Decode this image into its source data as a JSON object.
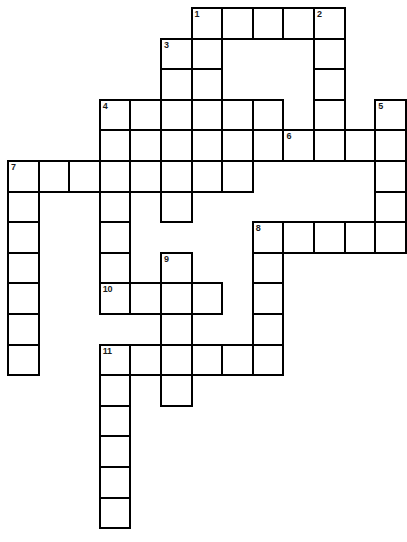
{
  "puzzle": {
    "title": "Crossword puzzle grid",
    "kind": "blank-crossword-grid",
    "cell_size": 30.6,
    "origin_x": 7,
    "origin_y": 7,
    "columns": 13,
    "rows": 17,
    "ink_color": "#000000",
    "cell_color": "#ffffff",
    "page_color": "#ffffff",
    "numbers": [
      "1",
      "2",
      "3",
      "4",
      "5",
      "6",
      "7",
      "8",
      "9",
      "10",
      "11"
    ],
    "entries": [
      {
        "number": "1",
        "direction": "across",
        "row": 0,
        "col": 6,
        "length": 5
      },
      {
        "number": "2",
        "direction": "down",
        "row": 0,
        "col": 10,
        "length": 5
      },
      {
        "number": "3",
        "direction": "across",
        "row": 1,
        "col": 5,
        "length": 2
      },
      {
        "number": "3",
        "direction": "down",
        "row": 1,
        "col": 5,
        "length": 2
      },
      {
        "number": "4",
        "direction": "across",
        "row": 3,
        "col": 3,
        "length": 6
      },
      {
        "number": "4",
        "direction": "down",
        "row": 3,
        "col": 3,
        "length": 7
      },
      {
        "number": "5",
        "direction": "down",
        "row": 3,
        "col": 12,
        "length": 5
      },
      {
        "number": "6",
        "direction": "across",
        "row": 4,
        "col": 9,
        "length": 4
      },
      {
        "number": "7",
        "direction": "across",
        "row": 5,
        "col": 0,
        "length": 8
      },
      {
        "number": "7",
        "direction": "down",
        "row": 5,
        "col": 0,
        "length": 7
      },
      {
        "number": "8",
        "direction": "across",
        "row": 7,
        "col": 8,
        "length": 5
      },
      {
        "number": "8",
        "direction": "down",
        "row": 7,
        "col": 8,
        "length": 6
      },
      {
        "number": "9",
        "direction": "down",
        "row": 8,
        "col": 5,
        "length": 4
      },
      {
        "number": "10",
        "direction": "across",
        "row": 9,
        "col": 3,
        "length": 4
      },
      {
        "number": "11",
        "direction": "across",
        "row": 11,
        "col": 3,
        "length": 5
      },
      {
        "number": "11",
        "direction": "down",
        "row": 11,
        "col": 3,
        "length": 6
      }
    ],
    "cells": [
      {
        "row": 0,
        "col": 6,
        "num": "1"
      },
      {
        "row": 0,
        "col": 7,
        "num": ""
      },
      {
        "row": 0,
        "col": 8,
        "num": ""
      },
      {
        "row": 0,
        "col": 9,
        "num": ""
      },
      {
        "row": 0,
        "col": 10,
        "num": "2"
      },
      {
        "row": 1,
        "col": 5,
        "num": "3"
      },
      {
        "row": 1,
        "col": 6,
        "num": ""
      },
      {
        "row": 1,
        "col": 10,
        "num": ""
      },
      {
        "row": 2,
        "col": 5,
        "num": ""
      },
      {
        "row": 2,
        "col": 6,
        "num": ""
      },
      {
        "row": 2,
        "col": 10,
        "num": ""
      },
      {
        "row": 3,
        "col": 3,
        "num": "4"
      },
      {
        "row": 3,
        "col": 4,
        "num": ""
      },
      {
        "row": 3,
        "col": 5,
        "num": ""
      },
      {
        "row": 3,
        "col": 6,
        "num": ""
      },
      {
        "row": 3,
        "col": 7,
        "num": ""
      },
      {
        "row": 3,
        "col": 8,
        "num": ""
      },
      {
        "row": 3,
        "col": 10,
        "num": ""
      },
      {
        "row": 3,
        "col": 12,
        "num": "5"
      },
      {
        "row": 4,
        "col": 3,
        "num": ""
      },
      {
        "row": 4,
        "col": 4,
        "num": ""
      },
      {
        "row": 4,
        "col": 5,
        "num": ""
      },
      {
        "row": 4,
        "col": 6,
        "num": ""
      },
      {
        "row": 4,
        "col": 7,
        "num": ""
      },
      {
        "row": 4,
        "col": 8,
        "num": ""
      },
      {
        "row": 4,
        "col": 9,
        "num": "6"
      },
      {
        "row": 4,
        "col": 10,
        "num": ""
      },
      {
        "row": 4,
        "col": 11,
        "num": ""
      },
      {
        "row": 4,
        "col": 12,
        "num": ""
      },
      {
        "row": 5,
        "col": 0,
        "num": "7"
      },
      {
        "row": 5,
        "col": 1,
        "num": ""
      },
      {
        "row": 5,
        "col": 2,
        "num": ""
      },
      {
        "row": 5,
        "col": 3,
        "num": ""
      },
      {
        "row": 5,
        "col": 4,
        "num": ""
      },
      {
        "row": 5,
        "col": 5,
        "num": ""
      },
      {
        "row": 5,
        "col": 6,
        "num": ""
      },
      {
        "row": 5,
        "col": 7,
        "num": ""
      },
      {
        "row": 5,
        "col": 12,
        "num": ""
      },
      {
        "row": 6,
        "col": 0,
        "num": ""
      },
      {
        "row": 6,
        "col": 3,
        "num": ""
      },
      {
        "row": 6,
        "col": 5,
        "num": ""
      },
      {
        "row": 6,
        "col": 12,
        "num": ""
      },
      {
        "row": 7,
        "col": 0,
        "num": ""
      },
      {
        "row": 7,
        "col": 3,
        "num": ""
      },
      {
        "row": 7,
        "col": 8,
        "num": "8"
      },
      {
        "row": 7,
        "col": 9,
        "num": ""
      },
      {
        "row": 7,
        "col": 10,
        "num": ""
      },
      {
        "row": 7,
        "col": 11,
        "num": ""
      },
      {
        "row": 7,
        "col": 12,
        "num": ""
      },
      {
        "row": 8,
        "col": 0,
        "num": ""
      },
      {
        "row": 8,
        "col": 3,
        "num": ""
      },
      {
        "row": 8,
        "col": 5,
        "num": "9"
      },
      {
        "row": 8,
        "col": 8,
        "num": ""
      },
      {
        "row": 9,
        "col": 0,
        "num": ""
      },
      {
        "row": 9,
        "col": 3,
        "num": "10"
      },
      {
        "row": 9,
        "col": 4,
        "num": ""
      },
      {
        "row": 9,
        "col": 5,
        "num": ""
      },
      {
        "row": 9,
        "col": 6,
        "num": ""
      },
      {
        "row": 9,
        "col": 8,
        "num": ""
      },
      {
        "row": 10,
        "col": 0,
        "num": ""
      },
      {
        "row": 10,
        "col": 5,
        "num": ""
      },
      {
        "row": 10,
        "col": 8,
        "num": ""
      },
      {
        "row": 11,
        "col": 0,
        "num": ""
      },
      {
        "row": 11,
        "col": 3,
        "num": "11"
      },
      {
        "row": 11,
        "col": 4,
        "num": ""
      },
      {
        "row": 11,
        "col": 5,
        "num": ""
      },
      {
        "row": 11,
        "col": 6,
        "num": ""
      },
      {
        "row": 11,
        "col": 7,
        "num": ""
      },
      {
        "row": 11,
        "col": 8,
        "num": ""
      },
      {
        "row": 12,
        "col": 3,
        "num": ""
      },
      {
        "row": 12,
        "col": 5,
        "num": ""
      },
      {
        "row": 13,
        "col": 3,
        "num": ""
      },
      {
        "row": 14,
        "col": 3,
        "num": ""
      },
      {
        "row": 15,
        "col": 3,
        "num": ""
      },
      {
        "row": 16,
        "col": 3,
        "num": ""
      }
    ]
  }
}
